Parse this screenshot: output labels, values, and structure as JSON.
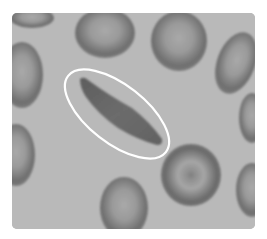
{
  "image": {
    "subject": "Micrograph of red blood cells with a sickle-shaped cell highlighted",
    "style": "grayscale",
    "background_color": "#b8b8b8",
    "cell_rim_color": "#6e6e6e",
    "cell_center_color": "#a4a4a4",
    "highlight_outline_color": "#ffffff",
    "highlight": {
      "shape": "ellipse",
      "target": "sickle-cell",
      "center": [
        117,
        114
      ],
      "rx": 62,
      "ry": 29,
      "rotation_deg": 38
    },
    "cells": [
      {
        "type": "normal",
        "cx": 105,
        "cy": 33,
        "rx": 30,
        "ry": 25
      },
      {
        "type": "normal",
        "cx": 179,
        "cy": 41,
        "rx": 29,
        "ry": 30
      },
      {
        "type": "normal",
        "cx": 236,
        "cy": 63,
        "rx": 19,
        "ry": 32,
        "rot": 20
      },
      {
        "type": "normal",
        "cx": 22,
        "cy": 75,
        "rx": 21,
        "ry": 33
      },
      {
        "type": "normal",
        "cx": 30,
        "cy": 20,
        "rx": 22,
        "ry": 10
      },
      {
        "type": "normal",
        "cx": 250,
        "cy": 118,
        "rx": 12,
        "ry": 24
      },
      {
        "type": "normal",
        "cx": 16,
        "cy": 155,
        "rx": 18,
        "ry": 30
      },
      {
        "type": "target-cell",
        "cx": 191,
        "cy": 175,
        "rx": 30,
        "ry": 31
      },
      {
        "type": "normal",
        "cx": 124,
        "cy": 207,
        "rx": 25,
        "ry": 30
      },
      {
        "type": "normal",
        "cx": 250,
        "cy": 188,
        "rx": 16,
        "ry": 26
      }
    ]
  }
}
